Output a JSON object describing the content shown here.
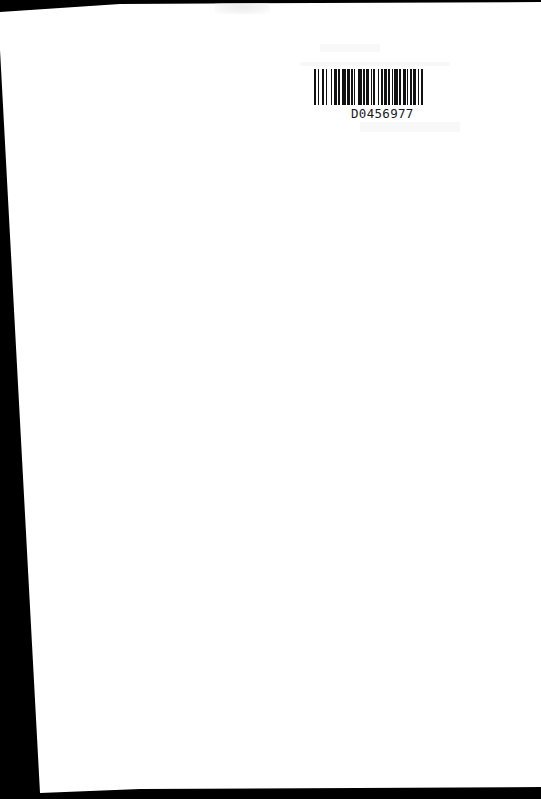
{
  "document": {
    "type": "scanned-page",
    "background_color": "#ffffff",
    "scan_border_color": "#000000",
    "barcode": {
      "label": "D0456977",
      "bar_color": "#111111"
    }
  }
}
